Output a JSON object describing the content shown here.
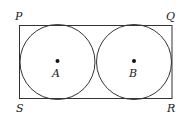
{
  "diagram": {
    "type": "geometry",
    "rectangle": {
      "vertices": {
        "P": "top-left",
        "Q": "top-right",
        "R": "bottom-right",
        "S": "bottom-left"
      }
    },
    "circles": [
      {
        "center_label": "A"
      },
      {
        "center_label": "B"
      }
    ],
    "labels": {
      "P": "P",
      "Q": "Q",
      "R": "R",
      "S": "S",
      "A": "A",
      "B": "B"
    },
    "colors": {
      "stroke": "#333333",
      "background": "#ffffff"
    }
  }
}
